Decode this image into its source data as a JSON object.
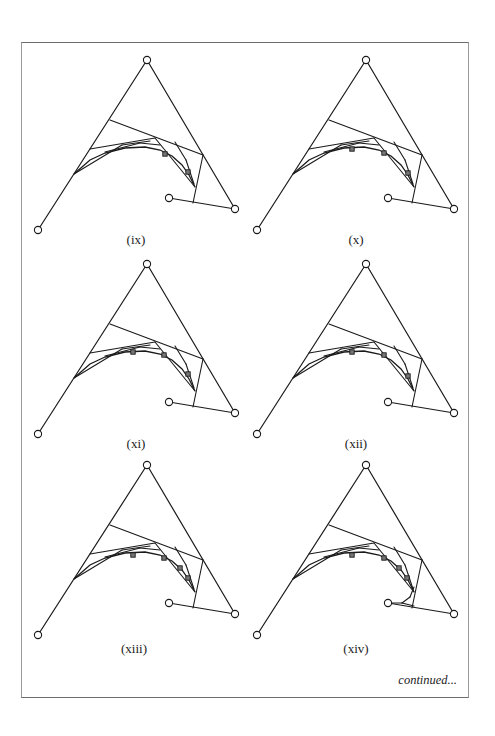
{
  "figure": {
    "continued_label": "continued...",
    "stroke_color": "#1a1a1a",
    "base_control_points": [
      [
        38,
        230
      ],
      [
        147,
        60
      ],
      [
        235,
        209
      ],
      [
        169,
        198
      ]
    ],
    "panels": [
      {
        "id": "ix",
        "label": "(ix)",
        "dx": 0,
        "dy": 0,
        "label_pos": [
          136,
          241
        ],
        "squares": [
          [
            165,
            154
          ],
          [
            188,
            172
          ]
        ],
        "extra_tail": false
      },
      {
        "id": "x",
        "label": "(x)",
        "dx": 219,
        "dy": 0,
        "label_pos": [
          356,
          241
        ],
        "squares": [
          [
            352,
            149
          ],
          [
            384,
            153
          ],
          [
            408,
            173
          ]
        ],
        "extra_tail": false
      },
      {
        "id": "xi",
        "label": "(xi)",
        "dx": 0,
        "dy": 204,
        "label_pos": [
          136,
          445
        ],
        "squares": [
          [
            133,
            352
          ],
          [
            164,
            355
          ],
          [
            188,
            374
          ]
        ],
        "extra_tail": false
      },
      {
        "id": "xii",
        "label": "(xii)",
        "dx": 219,
        "dy": 204,
        "label_pos": [
          356,
          445
        ],
        "squares": [
          [
            352,
            352
          ],
          [
            384,
            355
          ],
          [
            408,
            376
          ]
        ],
        "extra_tail": false
      },
      {
        "id": "xiii",
        "label": "(xiii)",
        "dx": 0,
        "dy": 405,
        "label_pos": [
          134,
          650
        ],
        "squares": [
          [
            133,
            555
          ],
          [
            164,
            558
          ],
          [
            180,
            568
          ],
          [
            188,
            578
          ]
        ],
        "extra_tail": false
      },
      {
        "id": "xiv",
        "label": "(xiv)",
        "dx": 219,
        "dy": 405,
        "label_pos": [
          356,
          650
        ],
        "squares": [
          [
            352,
            555
          ],
          [
            384,
            558
          ],
          [
            399,
            568
          ],
          [
            407,
            578
          ]
        ],
        "extra_tail": true
      }
    ],
    "construction_segments": [
      [
        [
          110,
          120
        ],
        [
          203,
          155
        ]
      ],
      [
        [
          203,
          155
        ],
        [
          193,
          203
        ]
      ],
      [
        [
          90,
          149
        ],
        [
          155,
          138
        ]
      ],
      [
        [
          155,
          138
        ],
        [
          195,
          187
        ]
      ],
      [
        [
          74,
          174
        ],
        [
          122,
          145
        ]
      ],
      [
        [
          122,
          145
        ],
        [
          150,
          141
        ]
      ],
      [
        [
          105,
          152
        ],
        [
          140,
          143
        ]
      ],
      [
        [
          140,
          143
        ],
        [
          160,
          145
        ]
      ],
      [
        [
          175,
          142
        ],
        [
          186,
          160
        ]
      ],
      [
        [
          186,
          160
        ],
        [
          194,
          184
        ]
      ]
    ],
    "curve_points": [
      [
        74,
        174
      ],
      [
        90,
        160
      ],
      [
        105,
        153
      ],
      [
        125,
        148
      ],
      [
        145,
        147
      ],
      [
        160,
        150
      ],
      [
        172,
        156
      ],
      [
        182,
        165
      ],
      [
        189,
        175
      ],
      [
        195,
        187
      ]
    ],
    "tail_segments_xiv": [
      [
        [
          414,
          587
        ],
        [
          410,
          597
        ]
      ],
      [
        [
          410,
          597
        ],
        [
          402,
          603
        ]
      ],
      [
        [
          402,
          603
        ],
        [
          389,
          603
        ]
      ],
      [
        [
          402,
          603
        ],
        [
          414,
          606
        ]
      ]
    ]
  }
}
